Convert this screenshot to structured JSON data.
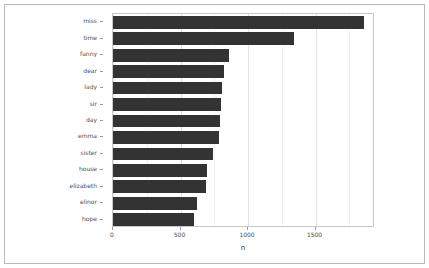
{
  "chart_data": {
    "type": "bar",
    "orientation": "horizontal",
    "title": "",
    "xlabel": "n",
    "ylabel": "",
    "categories": [
      "miss",
      "time",
      "fanny",
      "dear",
      "lady",
      "sir",
      "day",
      "emma",
      "sister",
      "house",
      "elizabeth",
      "elinor",
      "hope"
    ],
    "values": [
      1855,
      1337,
      862,
      822,
      809,
      801,
      790,
      787,
      737,
      699,
      685,
      623,
      601
    ],
    "xlim": [
      0,
      1940
    ],
    "x_ticks": [
      0,
      500,
      1000,
      1500
    ],
    "x_tick_labels": [
      "0",
      "500",
      "1000",
      "1500"
    ],
    "x_minor_ticks": [
      250,
      750,
      1250,
      1750
    ],
    "grid": {
      "major_vertical": true,
      "minor_vertical": true,
      "horizontal": false
    },
    "legend": null,
    "bar_color": "#333333",
    "panel_background": "#ffffff",
    "gridline_major_color": "#e4e4e4",
    "gridline_minor_color": "#f1f1f1",
    "panel_border_color": "#c8c8c8",
    "axis_text_color": "#4d4d4d",
    "figure_border_color": "#b9b9b9",
    "figure_background": "#ffffff"
  }
}
